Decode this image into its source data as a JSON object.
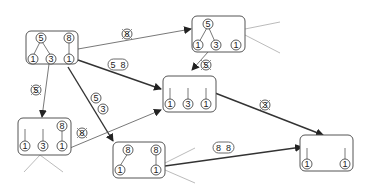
{
  "diagram": {
    "type": "tree-state-transition-graph",
    "nodes": [
      {
        "id": "A",
        "label_values": {
          "root1": "5",
          "root2": "8",
          "leaves": [
            "1",
            "3",
            "1"
          ]
        }
      },
      {
        "id": "B",
        "label_values": {
          "root1": "5",
          "leaves": [
            "1",
            "3",
            "1"
          ]
        }
      },
      {
        "id": "C",
        "label_values": {
          "leaves": [
            "1",
            "3",
            "1"
          ]
        }
      },
      {
        "id": "D",
        "label_values": {
          "root": "8",
          "leaves": [
            "1",
            "3",
            "1"
          ]
        }
      },
      {
        "id": "E",
        "label_values": {
          "root1": "8",
          "root2": "8",
          "leaves": [
            "1",
            "1"
          ]
        }
      },
      {
        "id": "F",
        "label_values": {
          "leaves": [
            "1",
            "1"
          ]
        }
      }
    ],
    "edges": [
      {
        "from": "A",
        "to": "B",
        "label": "8",
        "crossed": true
      },
      {
        "from": "A",
        "to": "C",
        "label": "5 8",
        "crossed": false
      },
      {
        "from": "A",
        "to": "D",
        "label": "5",
        "crossed": true
      },
      {
        "from": "A",
        "to": "E",
        "label": "5 3",
        "crossed": false
      },
      {
        "from": "B",
        "to": "C",
        "label": "5",
        "crossed": true
      },
      {
        "from": "C",
        "to": "F",
        "label": "3",
        "crossed": true
      },
      {
        "from": "D",
        "to": "C",
        "label": "8",
        "crossed": true
      },
      {
        "from": "E",
        "to": "F",
        "label": "8 8",
        "crossed": false
      }
    ]
  },
  "nodeA": {
    "c1": "5",
    "c2": "8",
    "c3": "1",
    "c4": "3",
    "c5": "1"
  },
  "nodeB": {
    "c1": "5",
    "c2": "1",
    "c3": "3",
    "c4": "1"
  },
  "nodeC": {
    "c1": "1",
    "c2": "3",
    "c3": "1"
  },
  "nodeD": {
    "c1": "8",
    "c2": "1",
    "c3": "3",
    "c4": "1"
  },
  "nodeE": {
    "c1": "8",
    "c2": "8",
    "c3": "1",
    "c4": "1"
  },
  "nodeF": {
    "c1": "1",
    "c2": "1"
  },
  "labels": {
    "ab": "8",
    "ac1": "5",
    "ac2": "8",
    "ad": "5",
    "ae1": "5",
    "ae2": "3",
    "bc": "5",
    "cf": "3",
    "dc": "8",
    "ef1": "8",
    "ef2": "8"
  },
  "colors": {
    "line": "#333333",
    "stub": "#aaaaaa",
    "background": "#ffffff"
  }
}
